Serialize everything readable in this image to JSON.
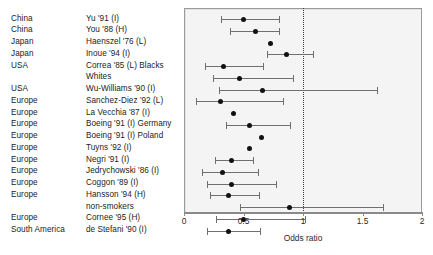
{
  "chart_data": {
    "type": "scatter",
    "title": "",
    "xlabel": "Odds ratio",
    "ylabel": "",
    "xlim": [
      0,
      2
    ],
    "xticks": [
      0,
      0.5,
      1,
      1.5,
      2
    ],
    "xtick_labels": [
      "0",
      "0.5",
      "1",
      "1.5",
      "2"
    ],
    "grid": false,
    "reference_line": 1,
    "legend": "none",
    "columns": [
      "Region",
      "Study",
      "Odds ratio",
      "CI low",
      "CI high"
    ],
    "rows": [
      {
        "region": "China",
        "study": "Yu '91 (I)",
        "or": 0.5,
        "lo": 0.31,
        "hi": 0.8
      },
      {
        "region": "China",
        "study": "You '88 (H)",
        "or": 0.6,
        "lo": 0.39,
        "hi": 0.8
      },
      {
        "region": "Japan",
        "study": "Haenszel '76 (L)",
        "or": 0.73,
        "lo": null,
        "hi": null
      },
      {
        "region": "Japan",
        "study": "Inoue '94 (I)",
        "or": 0.86,
        "lo": 0.7,
        "hi": 1.08
      },
      {
        "region": "USA",
        "study": "Correa '85 (L) Blacks",
        "or": 0.33,
        "lo": 0.18,
        "hi": 0.66
      },
      {
        "region": "",
        "study": "Whites",
        "or": 0.47,
        "lo": 0.24,
        "hi": 0.92
      },
      {
        "region": "USA",
        "study": "Wu-Williams '90 (I)",
        "or": 0.66,
        "lo": 0.29,
        "hi": 1.62
      },
      {
        "region": "Europe",
        "study": "Sanchez-Diez '92 (L)",
        "or": 0.31,
        "lo": 0.1,
        "hi": 0.83
      },
      {
        "region": "Europe",
        "study": "La Vecchia '87 (I)",
        "or": 0.42,
        "lo": null,
        "hi": null
      },
      {
        "region": "Europe",
        "study": "Boeing '91 (I) Germany",
        "or": 0.55,
        "lo": 0.35,
        "hi": 0.89
      },
      {
        "region": "Europe",
        "study": "Boeing '91 (I) Poland",
        "or": 0.65,
        "lo": null,
        "hi": null
      },
      {
        "region": "Europe",
        "study": "Tuyns '92 (I)",
        "or": 0.55,
        "lo": null,
        "hi": null
      },
      {
        "region": "Europe",
        "study": "Negri '91 (I)",
        "or": 0.4,
        "lo": 0.26,
        "hi": 0.58
      },
      {
        "region": "Europe",
        "study": "Jedrychowski '86 (I)",
        "or": 0.32,
        "lo": 0.15,
        "hi": 0.62
      },
      {
        "region": "Europe",
        "study": "Coggon '89 (I)",
        "or": 0.4,
        "lo": 0.19,
        "hi": 0.77
      },
      {
        "region": "Europe",
        "study": "Hansson '94 (H)",
        "or": 0.37,
        "lo": 0.22,
        "hi": 0.63
      },
      {
        "region": "",
        "study": "non-smokers",
        "or": 0.89,
        "lo": 0.47,
        "hi": 1.67
      },
      {
        "region": "Europe",
        "study": "Cornee '95 (H)",
        "or": 0.5,
        "lo": 0.27,
        "hi": 1.02
      },
      {
        "region": "South America",
        "study": "de Stefani '90 (I)",
        "or": 0.37,
        "lo": 0.19,
        "hi": 0.64
      }
    ]
  },
  "axis": {
    "title": "Odds ratio",
    "tick_labels": [
      "0",
      "0.5",
      "1",
      "1.5",
      "2"
    ]
  },
  "colors": {
    "marker": "#111111",
    "ci": "#6f6f6f",
    "plot_background": "#f4f4f4",
    "plot_border": "#9a9a9a",
    "reference_line": "#3a3a3a",
    "text": "#232323"
  }
}
